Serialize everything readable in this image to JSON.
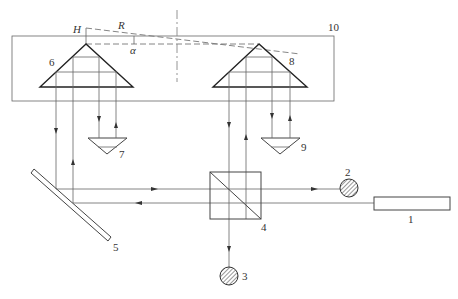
{
  "diagram": {
    "type": "optical-interferometer-schematic",
    "labels": {
      "laser": "1",
      "detector_2": "2",
      "detector_3": "3",
      "beam_splitter": "4",
      "mirror": "5",
      "prism_6": "6",
      "prism_7": "7",
      "prism_8": "8",
      "prism_9": "9",
      "frame": "10"
    },
    "geometry_labels": {
      "height": "H",
      "radius": "R",
      "angle": "α"
    },
    "components": [
      {
        "id": "1",
        "kind": "laser"
      },
      {
        "id": "2",
        "kind": "photodetector"
      },
      {
        "id": "3",
        "kind": "photodetector"
      },
      {
        "id": "4",
        "kind": "beam-splitter-cube"
      },
      {
        "id": "5",
        "kind": "plane-mirror"
      },
      {
        "id": "6",
        "kind": "corner-prism"
      },
      {
        "id": "7",
        "kind": "retro-prism"
      },
      {
        "id": "8",
        "kind": "corner-prism"
      },
      {
        "id": "9",
        "kind": "retro-prism"
      },
      {
        "id": "10",
        "kind": "frame"
      }
    ],
    "colors": {
      "line": "#444444",
      "background": "#ffffff"
    }
  }
}
